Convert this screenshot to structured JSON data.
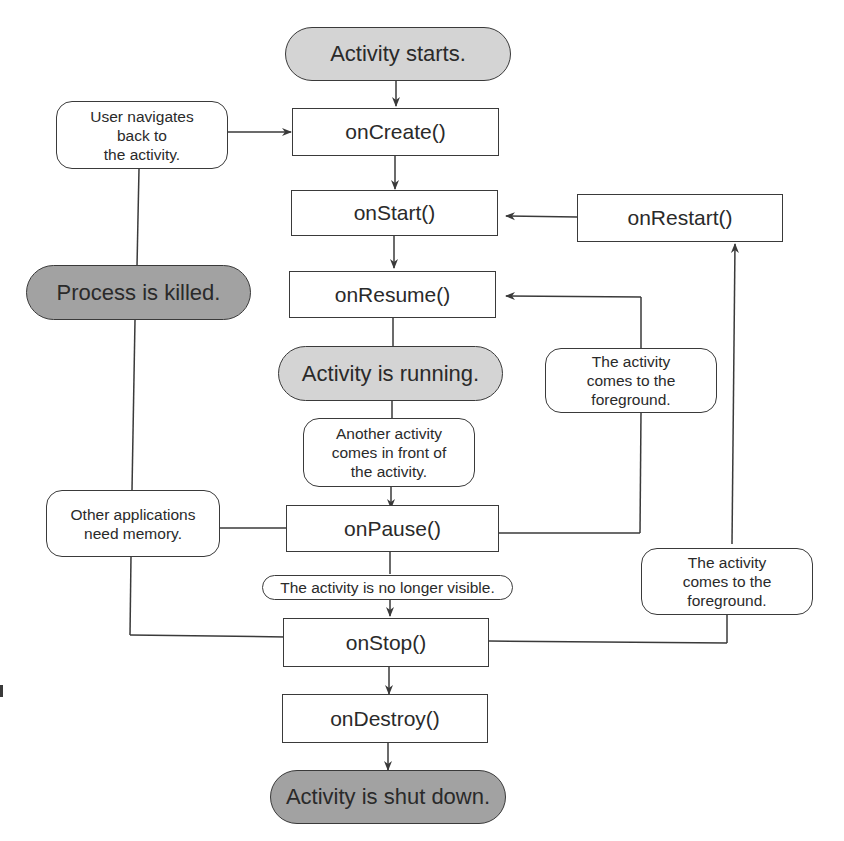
{
  "diagram": {
    "colors": {
      "line": "#3a3a3a",
      "start_state_fill": "#d4d4d4",
      "end_state_fill": "#a2a2a2",
      "box_fill": "#ffffff"
    },
    "states": {
      "activity_starts": "Activity starts.",
      "activity_running": "Activity is running.",
      "process_killed": "Process is killed.",
      "activity_shut_down": "Activity is shut down."
    },
    "callbacks": {
      "on_create": "onCreate()",
      "on_start": "onStart()",
      "on_restart": "onRestart()",
      "on_resume": "onResume()",
      "on_pause": "onPause()",
      "on_stop": "onStop()",
      "on_destroy": "onDestroy()"
    },
    "conditions": {
      "user_navigates_back": "User navigates\nback to\nthe activity.",
      "another_activity_in_front": "Another activity\ncomes in front of\nthe activity.",
      "other_apps_need_memory": "Other applications\nneed memory.",
      "foreground_to_resume": "The activity\ncomes to the\nforeground.",
      "no_longer_visible": "The activity is no longer visible.",
      "foreground_to_restart": "The activity\ncomes to the\nforeground."
    }
  }
}
